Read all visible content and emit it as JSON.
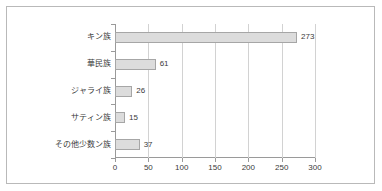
{
  "chart_data": {
    "type": "bar",
    "orientation": "horizontal",
    "title": "",
    "xlabel": "",
    "ylabel": "",
    "categories": [
      "キン族",
      "華民族",
      "ジャライ族",
      "サティン族",
      "その他少数ン族"
    ],
    "values": [
      273,
      61,
      26,
      15,
      37
    ],
    "value_labels": [
      "273",
      "61",
      "26",
      "15",
      "37"
    ],
    "xlim": [
      0,
      300
    ],
    "xticks": [
      0,
      50,
      100,
      150,
      200,
      250,
      300
    ],
    "xtick_labels": [
      "0",
      "50",
      "100",
      "150",
      "200",
      "250",
      "300"
    ],
    "grid": "vertical",
    "legend": "none",
    "colors": {
      "bar_fill": "#dcdcdc",
      "bar_border": "#a6a6a6",
      "gridline": "#d2d2d2",
      "axis": "#9a9a9a",
      "text": "#3a3a3a",
      "frame": "#b9b9b9",
      "background": "#ffffff"
    }
  }
}
